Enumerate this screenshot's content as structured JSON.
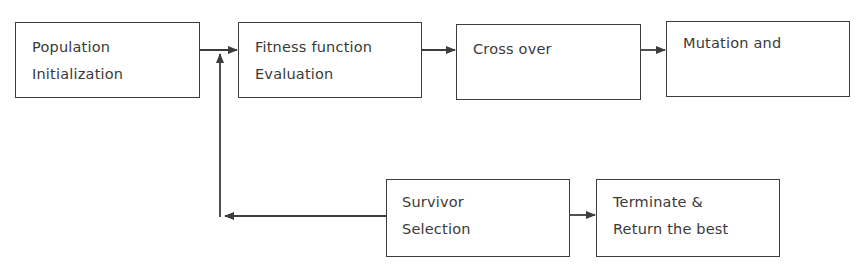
{
  "diagram": {
    "type": "flowchart",
    "title": "",
    "nodes": [
      {
        "id": "population-initialization",
        "lines": [
          "Population",
          "Initialization"
        ]
      },
      {
        "id": "fitness-evaluation",
        "lines": [
          "Fitness function",
          "Evaluation"
        ]
      },
      {
        "id": "cross-over",
        "lines": [
          "Cross over"
        ]
      },
      {
        "id": "mutation",
        "lines": [
          "Mutation and"
        ]
      },
      {
        "id": "survivor-selection",
        "lines": [
          "Survivor",
          "Selection"
        ]
      },
      {
        "id": "terminate",
        "lines": [
          "Terminate &",
          "Return the best"
        ]
      }
    ],
    "edges": [
      {
        "from": "population-initialization",
        "to": "fitness-evaluation"
      },
      {
        "from": "fitness-evaluation",
        "to": "cross-over"
      },
      {
        "from": "cross-over",
        "to": "mutation"
      },
      {
        "from": "survivor-selection",
        "to": "fitness-evaluation",
        "note": "loop back"
      },
      {
        "from": "survivor-selection",
        "to": "terminate"
      }
    ],
    "colors": {
      "stroke": "#3d3d3d",
      "text": "#3a3a3a",
      "background": "#ffffff"
    }
  }
}
